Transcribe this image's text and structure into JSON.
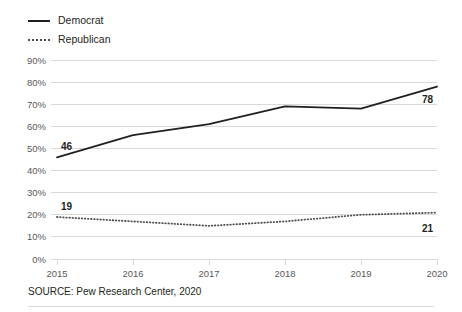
{
  "legend": {
    "items": [
      {
        "label": "Democrat",
        "style": "solid",
        "color": "#231f20"
      },
      {
        "label": "Republican",
        "style": "dotted",
        "color": "#4d4d4d"
      }
    ]
  },
  "source": {
    "text": "SOURCE: Pew Research Center, 2020"
  },
  "colors": {
    "democrat_line": "#231f20",
    "republican_line": "#4d4d4d",
    "gridline": "#d9d9d9",
    "axis_text": "#58595b",
    "label_text": "#231f20",
    "background": "#ffffff"
  },
  "chart_data": {
    "type": "line",
    "title": "",
    "subtitle": "",
    "xlabel": "",
    "ylabel": "",
    "x": [
      2015,
      2016,
      2017,
      2018,
      2019,
      2020
    ],
    "xtick_labels": [
      "2015",
      "2016",
      "2017",
      "2018",
      "2019",
      "2020"
    ],
    "ytick_values": [
      0,
      10,
      20,
      30,
      40,
      50,
      60,
      70,
      80,
      90
    ],
    "ytick_labels": [
      "0%",
      "10%",
      "20%",
      "30%",
      "40%",
      "50%",
      "60%",
      "70%",
      "80%",
      "90%"
    ],
    "ylim": [
      0,
      90
    ],
    "xlim": [
      2015,
      2020
    ],
    "grid": true,
    "legend_position": "top-left",
    "series": [
      {
        "name": "Democrat",
        "style": "solid",
        "color": "#231f20",
        "values": [
          46,
          56,
          61,
          69,
          68,
          78
        ],
        "endpoint_labels": {
          "first": "46",
          "last": "78"
        }
      },
      {
        "name": "Republican",
        "style": "dotted",
        "color": "#4d4d4d",
        "values": [
          19,
          17,
          15,
          17,
          20,
          21
        ],
        "endpoint_labels": {
          "first": "19",
          "last": "21"
        }
      }
    ]
  }
}
